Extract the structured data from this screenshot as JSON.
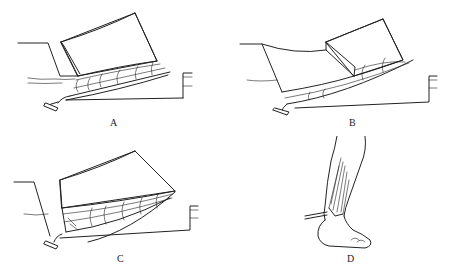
{
  "figure": {
    "panels": [
      {
        "id": "A",
        "label": "A",
        "description": "flap elevated off muscle with perforator vessels"
      },
      {
        "id": "B",
        "label": "B",
        "description": "flap advanced along fascial layer"
      },
      {
        "id": "C",
        "label": "C",
        "description": "composite flap block rotated"
      },
      {
        "id": "D",
        "label": "D",
        "description": "lower leg and foot with flap at ankle"
      }
    ]
  }
}
